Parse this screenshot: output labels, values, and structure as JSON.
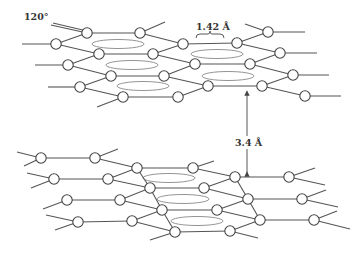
{
  "diagram": {
    "labels": {
      "angle": "120°",
      "bond_length": "1.42 Å",
      "interlayer_spacing": "3.4 Å"
    },
    "colors": {
      "line": "#555555",
      "atom_fill": "#ffffff",
      "pi_orbital": "#888888"
    },
    "layers": [
      {
        "name": "top-layer",
        "atoms": [
          [
            87,
            33
          ],
          [
            140,
            33
          ],
          [
            268,
            32
          ],
          [
            56,
            44
          ],
          [
            183,
            44
          ],
          [
            237,
            43
          ],
          [
            99,
            54
          ],
          [
            153,
            54
          ],
          [
            280,
            53
          ],
          [
            68,
            65
          ],
          [
            195,
            64
          ],
          [
            250,
            64
          ],
          [
            111,
            76
          ],
          [
            164,
            76
          ],
          [
            293,
            75
          ],
          [
            80,
            87
          ],
          [
            208,
            86
          ],
          [
            262,
            86
          ],
          [
            123,
            97
          ],
          [
            178,
            97
          ],
          [
            305,
            96
          ]
        ],
        "bonds": [
          [
            87,
            33,
            140,
            33
          ],
          [
            56,
            44,
            87,
            33
          ],
          [
            56,
            44,
            99,
            54
          ],
          [
            140,
            33,
            183,
            44
          ],
          [
            140,
            33,
            165,
            22
          ],
          [
            183,
            44,
            237,
            43
          ],
          [
            237,
            43,
            268,
            32
          ],
          [
            237,
            43,
            280,
            53
          ],
          [
            268,
            32,
            305,
            32
          ],
          [
            268,
            32,
            245,
            24
          ],
          [
            99,
            54,
            153,
            54
          ],
          [
            68,
            65,
            99,
            54
          ],
          [
            68,
            65,
            111,
            76
          ],
          [
            153,
            54,
            183,
            44
          ],
          [
            153,
            54,
            195,
            64
          ],
          [
            195,
            64,
            250,
            64
          ],
          [
            250,
            64,
            280,
            53
          ],
          [
            250,
            64,
            293,
            75
          ],
          [
            280,
            53,
            317,
            53
          ],
          [
            111,
            76,
            164,
            76
          ],
          [
            80,
            87,
            111,
            76
          ],
          [
            80,
            87,
            123,
            97
          ],
          [
            164,
            76,
            195,
            64
          ],
          [
            164,
            76,
            208,
            86
          ],
          [
            208,
            86,
            262,
            86
          ],
          [
            262,
            86,
            293,
            75
          ],
          [
            262,
            86,
            305,
            96
          ],
          [
            293,
            75,
            329,
            75
          ],
          [
            123,
            97,
            178,
            97
          ],
          [
            178,
            97,
            208,
            86
          ],
          [
            305,
            96,
            341,
            96
          ],
          [
            123,
            97,
            97,
            107
          ],
          [
            22,
            44,
            56,
            44
          ],
          [
            35,
            65,
            68,
            65
          ],
          [
            48,
            87,
            80,
            87
          ],
          [
            51,
            25,
            87,
            33
          ],
          [
            53,
            23,
            87,
            31
          ]
        ],
        "pi_orbitals": [
          [
            118,
            44,
            26,
            4.5
          ],
          [
            132,
            65,
            26,
            4.5
          ],
          [
            143,
            86,
            26,
            4.5
          ],
          [
            217,
            54,
            26,
            4.5
          ],
          [
            228,
            76,
            26,
            4.5
          ]
        ]
      },
      {
        "name": "bottom-layer",
        "atoms": [
          [
            41,
            158
          ],
          [
            95,
            158
          ],
          [
            137,
            168
          ],
          [
            193,
            168
          ],
          [
            54,
            179
          ],
          [
            108,
            179
          ],
          [
            235,
            177
          ],
          [
            289,
            177
          ],
          [
            150,
            188
          ],
          [
            204,
            188
          ],
          [
            67,
            200
          ],
          [
            120,
            200
          ],
          [
            248,
            199
          ],
          [
            302,
            199
          ],
          [
            162,
            210
          ],
          [
            217,
            210
          ],
          [
            78,
            222
          ],
          [
            132,
            221
          ],
          [
            260,
            220
          ],
          [
            314,
            220
          ],
          [
            175,
            232
          ],
          [
            230,
            231
          ]
        ],
        "bonds": [
          [
            41,
            158,
            95,
            158
          ],
          [
            17,
            152,
            41,
            158
          ],
          [
            24,
            166,
            41,
            158
          ],
          [
            95,
            158,
            118,
            149
          ],
          [
            95,
            158,
            137,
            168
          ],
          [
            137,
            168,
            193,
            168
          ],
          [
            108,
            179,
            137,
            168
          ],
          [
            137,
            168,
            150,
            188
          ],
          [
            193,
            168,
            214,
            161
          ],
          [
            193,
            168,
            235,
            177
          ],
          [
            54,
            179,
            108,
            179
          ],
          [
            27,
            173,
            54,
            179
          ],
          [
            31,
            188,
            54,
            179
          ],
          [
            108,
            179,
            150,
            188
          ],
          [
            235,
            177,
            289,
            177
          ],
          [
            289,
            177,
            315,
            168
          ],
          [
            289,
            177,
            325,
            185
          ],
          [
            204,
            188,
            235,
            177
          ],
          [
            235,
            177,
            248,
            199
          ],
          [
            150,
            188,
            204,
            188
          ],
          [
            120,
            200,
            150,
            188
          ],
          [
            150,
            188,
            162,
            210
          ],
          [
            204,
            188,
            248,
            199
          ],
          [
            67,
            200,
            120,
            200
          ],
          [
            43,
            209,
            67,
            200
          ],
          [
            120,
            200,
            162,
            210
          ],
          [
            248,
            199,
            302,
            199
          ],
          [
            302,
            199,
            326,
            190
          ],
          [
            302,
            199,
            338,
            207
          ],
          [
            217,
            210,
            248,
            199
          ],
          [
            248,
            199,
            260,
            220
          ],
          [
            162,
            210,
            217,
            210
          ],
          [
            132,
            221,
            162,
            210
          ],
          [
            162,
            210,
            175,
            232
          ],
          [
            217,
            210,
            260,
            220
          ],
          [
            78,
            222,
            132,
            221
          ],
          [
            46,
            215,
            78,
            222
          ],
          [
            55,
            230,
            78,
            222
          ],
          [
            132,
            221,
            175,
            232
          ],
          [
            260,
            220,
            314,
            220
          ],
          [
            314,
            220,
            337,
            211
          ],
          [
            314,
            220,
            350,
            229
          ],
          [
            230,
            231,
            260,
            220
          ],
          [
            175,
            232,
            230,
            231
          ],
          [
            150,
            240,
            175,
            232
          ],
          [
            230,
            231,
            258,
            238
          ]
        ],
        "pi_orbitals": [
          [
            169,
            178,
            26,
            4.5
          ],
          [
            183,
            199,
            26,
            4.5
          ],
          [
            197,
            221,
            26,
            4.5
          ]
        ]
      }
    ],
    "annotations": {
      "angle_label_pos": [
        24,
        20
      ],
      "bond_label_pos": [
        196,
        28
      ],
      "brace": [
        196,
        36,
        224,
        36
      ],
      "spacing_arrow": [
        247,
        90,
        247,
        177
      ],
      "spacing_label_pos": [
        236,
        146
      ]
    }
  }
}
